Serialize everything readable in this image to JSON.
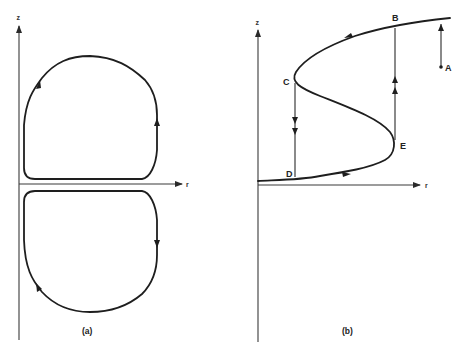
{
  "figure": {
    "panels": [
      {
        "id": "a",
        "caption": "(a)",
        "axes": {
          "vertical_label": "z",
          "horizontal_label": "r"
        },
        "description": "Two closed circulation loops, one above and one below the r-axis, with direction arrows",
        "loops": [
          {
            "name": "upper-loop",
            "direction": "counterclockwise"
          },
          {
            "name": "lower-loop",
            "direction": "clockwise"
          }
        ]
      },
      {
        "id": "b",
        "caption": "(b)",
        "axes": {
          "vertical_label": "z",
          "horizontal_label": "r"
        },
        "description": "S-shaped equilibrium curve with hysteresis jumps",
        "points": [
          {
            "label": "A"
          },
          {
            "label": "B"
          },
          {
            "label": "C"
          },
          {
            "label": "D"
          },
          {
            "label": "E"
          }
        ],
        "transitions": [
          {
            "from": "A",
            "to": "B",
            "kind": "jump-up"
          },
          {
            "from": "B",
            "to": "C",
            "kind": "along-curve"
          },
          {
            "from": "C",
            "to": "D",
            "kind": "jump-down"
          },
          {
            "from": "D",
            "to": "E",
            "kind": "along-curve"
          },
          {
            "from": "E",
            "to": "B",
            "kind": "jump-up"
          }
        ]
      }
    ]
  }
}
